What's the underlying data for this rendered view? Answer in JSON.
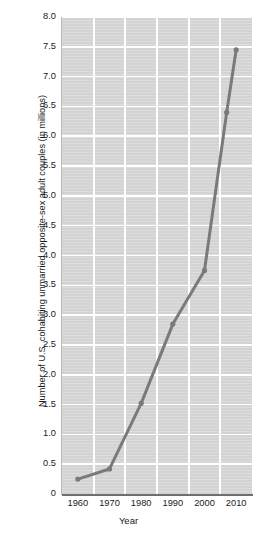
{
  "chart_data": {
    "type": "line",
    "title": "",
    "xlabel": "Year",
    "ylabel": "Number of U.S. cohabiting unmarried opposite-sex adult couples (in millions)",
    "xlim": [
      1955,
      2015
    ],
    "ylim": [
      0,
      8.0
    ],
    "grid": true,
    "legend": "none",
    "x_ticks": [
      "1960",
      "1970",
      "1980",
      "1990",
      "2000",
      "2010"
    ],
    "x_tick_values": [
      1960,
      1970,
      1980,
      1990,
      2000,
      2010
    ],
    "y_ticks": [
      "0",
      "0.5",
      "1.0",
      "1.5",
      "2.0",
      "2.5",
      "3.0",
      "3.5",
      "4.0",
      "4.5",
      "5.0",
      "5.5",
      "6.0",
      "6.5",
      "7.0",
      "7.5",
      "8.0"
    ],
    "y_tick_values": [
      0,
      0.5,
      1.0,
      1.5,
      2.0,
      2.5,
      3.0,
      3.5,
      4.0,
      4.5,
      5.0,
      5.5,
      6.0,
      6.5,
      7.0,
      7.5,
      8.0
    ],
    "series": [
      {
        "name": "Cohabiting unmarried opposite-sex adult couples",
        "x": [
          1960,
          1970,
          1980,
          1990,
          2000,
          2007,
          2010
        ],
        "values": [
          0.25,
          0.42,
          1.52,
          2.85,
          3.75,
          6.4,
          7.45
        ],
        "color": "#7a7a7a",
        "marker": "circle",
        "line_width": 3
      }
    ],
    "colors": {
      "line": "#7a7a7a",
      "plot_background": "#d3d3d3",
      "gridline": "#ffffff",
      "axis": "#6f6f6f",
      "text": "#1a1a1a",
      "page_background": "#ffffff"
    }
  }
}
